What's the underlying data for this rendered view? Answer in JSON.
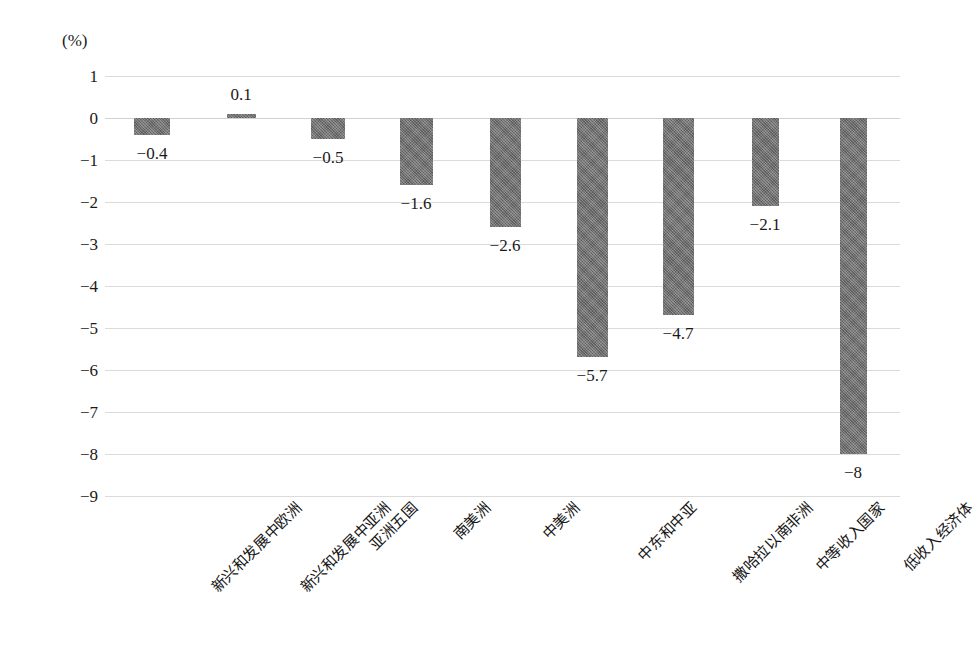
{
  "chart_data": {
    "type": "bar",
    "title": "",
    "subtitle": "",
    "xlabel": "",
    "ylabel": "",
    "unit_label": "(%)",
    "ylim": [
      -9,
      1
    ],
    "ytick_step": 1,
    "ytick_labels": [
      "1",
      "0",
      "−1",
      "−2",
      "−3",
      "−4",
      "−5",
      "−6",
      "−7",
      "−8",
      "−9"
    ],
    "ytick_values": [
      1,
      0,
      -1,
      -2,
      -3,
      -4,
      -5,
      -6,
      -7,
      -8,
      -9
    ],
    "grid": true,
    "grid_orientation": "horizontal",
    "legend": false,
    "legend_position": "none",
    "bar_color": "#6e6e6e",
    "categories": [
      "新兴和发展中欧洲",
      "新兴和发展中亚洲",
      "亚洲五国",
      "南美洲",
      "中美洲",
      "中东和中亚",
      "撒哈拉以南非洲",
      "中等收入国家",
      "低收入经济体"
    ],
    "values": [
      -0.4,
      0.1,
      -0.5,
      -1.6,
      -2.6,
      -5.7,
      -4.7,
      -2.1,
      -8
    ],
    "value_labels": [
      "−0.4",
      "0.1",
      "−0.5",
      "−1.6",
      "−2.6",
      "−5.7",
      "−4.7",
      "−2.1",
      "−8"
    ]
  }
}
